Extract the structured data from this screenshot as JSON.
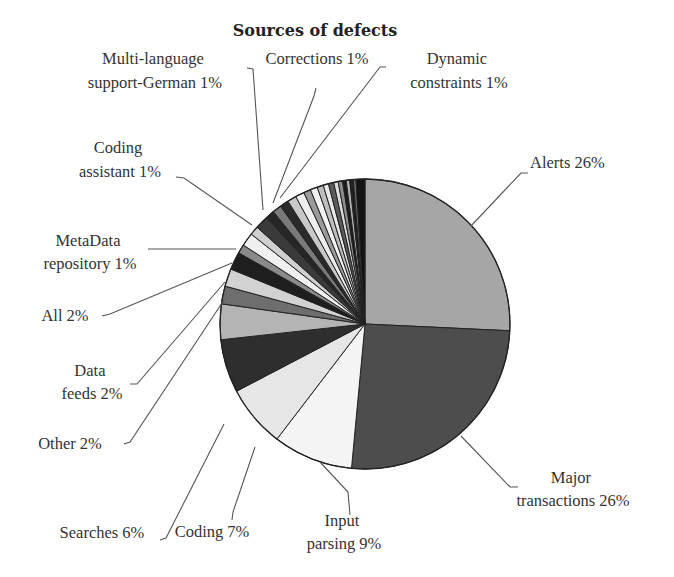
{
  "chart_data": {
    "type": "pie",
    "title": "Sources of defects",
    "start_angle_deg": 0,
    "direction": "clockwise",
    "slices": [
      {
        "label": "Alerts",
        "value": 26,
        "display": "Alerts 26%",
        "fill": "#a6a6a6"
      },
      {
        "label": "Major transactions",
        "value": 26,
        "display": "Major transactions 26%",
        "fill": "#4d4d4d"
      },
      {
        "label": "Input parsing",
        "value": 9,
        "display": "Input parsing 9%",
        "fill": "#f4f4f4"
      },
      {
        "label": "Coding",
        "value": 7,
        "display": "Coding 7%",
        "fill": "#e6e6e6"
      },
      {
        "label": "Searches",
        "value": 6,
        "display": "Searches 6%",
        "fill": "#2e2e2e"
      },
      {
        "label": "(unlabeled)",
        "value": 4,
        "display": "",
        "fill": "#b4b4b4"
      },
      {
        "label": "Other",
        "value": 2,
        "display": "Other 2%",
        "fill": "#6e6e6e"
      },
      {
        "label": "Data feeds",
        "value": 2,
        "display": "Data feeds 2%",
        "fill": "#d2d2d2"
      },
      {
        "label": "All",
        "value": 2,
        "display": "All 2%",
        "fill": "#1e1e1e"
      },
      {
        "label": "MetaData repository",
        "value": 1,
        "display": "MetaData repository 1%",
        "fill": "#8a8a8a"
      },
      {
        "label": "(unlabeled)",
        "value": 1.5,
        "display": "",
        "fill": "#f0f0f0"
      },
      {
        "label": "Coding assistant",
        "value": 1,
        "display": "Coding assistant 1%",
        "fill": "#cfcfcf"
      },
      {
        "label": "(unlabeled)",
        "value": 1.5,
        "display": "",
        "fill": "#3a3a3a"
      },
      {
        "label": "Multi-language support-German",
        "value": 1,
        "display": "Multi-language support-German 1%",
        "fill": "#262626"
      },
      {
        "label": "(unlabeled)",
        "value": 1,
        "display": "",
        "fill": "#7a7a7a"
      },
      {
        "label": "Corrections",
        "value": 1,
        "display": "Corrections 1%",
        "fill": "#2a2a2a"
      },
      {
        "label": "Dynamic constraints",
        "value": 1,
        "display": "Dynamic constraints 1%",
        "fill": "#c8c8c8"
      },
      {
        "label": "(unlabeled)",
        "value": 1,
        "display": "",
        "fill": "#eeeeee"
      },
      {
        "label": "(unlabeled)",
        "value": 0.8,
        "display": "",
        "fill": "#9a9a9a"
      },
      {
        "label": "(unlabeled)",
        "value": 0.8,
        "display": "",
        "fill": "#f2f2f2"
      },
      {
        "label": "(unlabeled)",
        "value": 0.7,
        "display": "",
        "fill": "#bdbdbd"
      },
      {
        "label": "(unlabeled)",
        "value": 0.6,
        "display": "",
        "fill": "#e8e8e8"
      },
      {
        "label": "(unlabeled)",
        "value": 0.6,
        "display": "",
        "fill": "#5a5a5a"
      },
      {
        "label": "(unlabeled)",
        "value": 0.5,
        "display": "",
        "fill": "#dcdcdc"
      },
      {
        "label": "(unlabeled)",
        "value": 0.5,
        "display": "",
        "fill": "#8c8c8c"
      },
      {
        "label": "(unlabeled)",
        "value": 0.4,
        "display": "",
        "fill": "#1a1a1a"
      },
      {
        "label": "(unlabeled)",
        "value": 0.4,
        "display": "",
        "fill": "#b0b0b0"
      },
      {
        "label": "(unlabeled)",
        "value": 0.4,
        "display": "",
        "fill": "#202020"
      },
      {
        "label": "(unlabeled)",
        "value": 0.3,
        "display": "",
        "fill": "#6a6a6a"
      },
      {
        "label": "(unlabeled)",
        "value": 1.0,
        "display": "",
        "fill": "#141414"
      }
    ],
    "labels": [
      {
        "key": "alerts",
        "lines": [
          "Alerts 26%"
        ]
      },
      {
        "key": "major",
        "lines": [
          "Major",
          "transactions 26%"
        ]
      },
      {
        "key": "input",
        "lines": [
          "Input",
          "parsing 9%"
        ]
      },
      {
        "key": "coding",
        "lines": [
          "Coding 7%"
        ]
      },
      {
        "key": "searches",
        "lines": [
          "Searches 6%"
        ]
      },
      {
        "key": "other",
        "lines": [
          "Other 2%"
        ]
      },
      {
        "key": "datafeeds",
        "lines": [
          "Data",
          "feeds 2%"
        ]
      },
      {
        "key": "all",
        "lines": [
          "All 2%"
        ]
      },
      {
        "key": "metadata",
        "lines": [
          "MetaData",
          "repository 1%"
        ]
      },
      {
        "key": "codingassistant",
        "lines": [
          "Coding",
          "assistant 1%"
        ]
      },
      {
        "key": "multilang",
        "lines": [
          "Multi-language",
          "support-German 1%"
        ]
      },
      {
        "key": "corrections",
        "lines": [
          "Corrections 1%"
        ]
      },
      {
        "key": "dynamic",
        "lines": [
          "Dynamic",
          "constraints 1%"
        ]
      }
    ],
    "legend": "none",
    "grid": false
  }
}
